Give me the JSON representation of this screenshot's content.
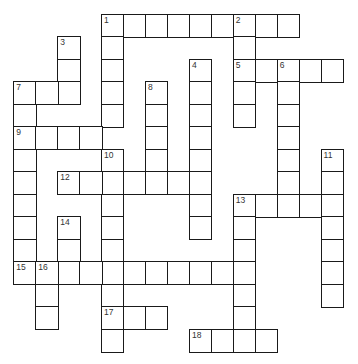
{
  "puzzle": {
    "type": "crossword",
    "grid": {
      "origin_x": 14,
      "origin_y": 14.5,
      "cell_w": 21.95,
      "cell_h": 22.5,
      "line_color": "#1a1a1a",
      "number_color": "#333333"
    },
    "entries": [
      {
        "number": "1",
        "direction": "across",
        "row": 0,
        "col": 4,
        "length": 9
      },
      {
        "number": "1",
        "direction": "down",
        "row": 0,
        "col": 4,
        "length": 5
      },
      {
        "number": "2",
        "direction": "down",
        "row": 0,
        "col": 10,
        "length": 5
      },
      {
        "number": "3",
        "direction": "down",
        "row": 1,
        "col": 2,
        "length": 3
      },
      {
        "number": "4",
        "direction": "down",
        "row": 2,
        "col": 8,
        "length": 8
      },
      {
        "number": "5",
        "direction": "across",
        "row": 2,
        "col": 10,
        "length": 5
      },
      {
        "number": "6",
        "direction": "down",
        "row": 2,
        "col": 12,
        "length": 7
      },
      {
        "number": "7",
        "direction": "across",
        "row": 3,
        "col": 0,
        "length": 3
      },
      {
        "number": "7",
        "direction": "down",
        "row": 3,
        "col": 0,
        "length": 9
      },
      {
        "number": "8",
        "direction": "down",
        "row": 3,
        "col": 6,
        "length": 5
      },
      {
        "number": "9",
        "direction": "across",
        "row": 5,
        "col": 0,
        "length": 4
      },
      {
        "number": "10",
        "direction": "down",
        "row": 6,
        "col": 4,
        "length": 9
      },
      {
        "number": "11",
        "direction": "down",
        "row": 6,
        "col": 14,
        "length": 7
      },
      {
        "number": "12",
        "direction": "across",
        "row": 7,
        "col": 2,
        "length": 7
      },
      {
        "number": "13",
        "direction": "across",
        "row": 8,
        "col": 10,
        "length": 5
      },
      {
        "number": "13",
        "direction": "down",
        "row": 8,
        "col": 10,
        "length": 7
      },
      {
        "number": "14",
        "direction": "down",
        "row": 9,
        "col": 2,
        "length": 3
      },
      {
        "number": "15",
        "direction": "across",
        "row": 11,
        "col": 0,
        "length": 11
      },
      {
        "number": "16",
        "direction": "down",
        "row": 11,
        "col": 1,
        "length": 3
      },
      {
        "number": "17",
        "direction": "across",
        "row": 13,
        "col": 4,
        "length": 3
      },
      {
        "number": "18",
        "direction": "across",
        "row": 14,
        "col": 8,
        "length": 4
      }
    ]
  }
}
